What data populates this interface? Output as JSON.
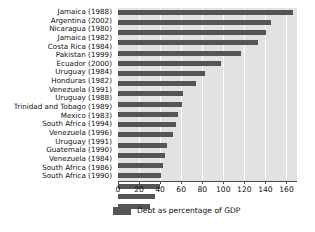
{
  "chart_data": {
    "type": "bar",
    "orientation": "horizontal",
    "title": "",
    "xlabel": "",
    "ylabel": "",
    "xlim": [
      0,
      170
    ],
    "xticks": [
      0,
      20,
      40,
      60,
      80,
      100,
      120,
      140,
      160
    ],
    "grid": true,
    "legend": {
      "position": "bottom",
      "entries": [
        {
          "label": "Debt as percentage of GDP",
          "color": "#555555"
        }
      ]
    },
    "series_name": "Debt as percentage of GDP",
    "bar_color": "#555555",
    "plot_background": "#e2e2e2",
    "gridline_color": "#ffffff",
    "categories": [
      "Jamaica (1988)",
      "Argentina (2002)",
      "Nicaragua (1980)",
      "Jamaica (1982)",
      "Costa Rica (1984)",
      "Pakistan (1999)",
      "Ecuador (2000)",
      "Uruguay (1984)",
      "Honduras (1982)",
      "Venezuela (1991)",
      "Uruguay (1988)",
      "Trinidad and Tobago (1989)",
      "Mexico (1983)",
      "South Africa (1994)",
      "Venezuela (1996)",
      "Uruguay (1991)",
      "Guatemala (1990)",
      "Venezuela (1984)",
      "South Africa (1986)",
      "South Africa (1990)"
    ],
    "values": [
      166,
      145,
      141,
      133,
      117,
      98,
      83,
      74,
      62,
      61,
      57,
      55,
      52,
      47,
      45,
      43,
      41,
      40,
      35,
      30
    ]
  }
}
